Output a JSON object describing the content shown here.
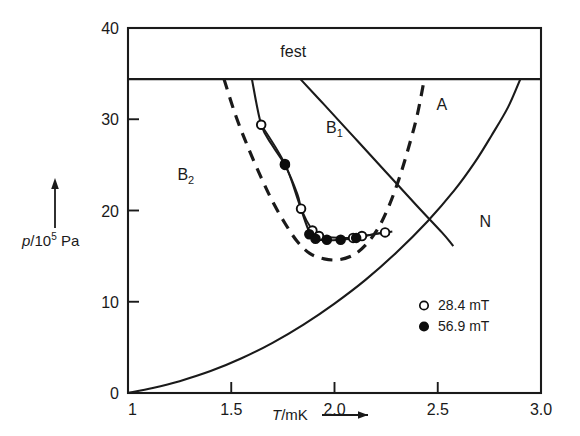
{
  "chart_data": {
    "type": "line",
    "title": "",
    "xlabel": "T/mK",
    "ylabel": "p/10^5 Pa",
    "xlim": [
      1.0,
      3.0
    ],
    "ylim": [
      0,
      40
    ],
    "grid": false,
    "xticks": [
      "1",
      "1.5",
      "2.0",
      "2.5",
      "3.0"
    ],
    "xtick_values": [
      1.0,
      1.5,
      2.0,
      2.5,
      3.0
    ],
    "yticks": [
      "0",
      "10",
      "20",
      "30",
      "40"
    ],
    "ytick_values": [
      0,
      10,
      20,
      30,
      40
    ],
    "legend_position": "lower-right",
    "legend": [
      {
        "marker": "open-circle",
        "label": "28.4 mT"
      },
      {
        "marker": "filled-circle",
        "label": "56.9 mT"
      }
    ],
    "region_labels": [
      {
        "text": "fest",
        "T": 1.8,
        "p": 36.8
      },
      {
        "text": "B",
        "sub": "2",
        "T": 1.28,
        "p": 23.3
      },
      {
        "text": "B",
        "sub": "1",
        "T": 2.0,
        "p": 28.5
      },
      {
        "text": "A",
        "T": 2.52,
        "p": 31.0
      },
      {
        "text": "N",
        "T": 2.73,
        "p": 18.2
      }
    ],
    "series": [
      {
        "name": "28.4 mT",
        "marker": "open-circle",
        "points": [
          {
            "T": 1.645,
            "p": 29.4
          },
          {
            "T": 1.76,
            "p": 25.1
          },
          {
            "T": 1.838,
            "p": 20.2
          },
          {
            "T": 1.893,
            "p": 17.8
          },
          {
            "T": 1.925,
            "p": 17.2
          },
          {
            "T": 2.09,
            "p": 17.0
          },
          {
            "T": 2.133,
            "p": 17.2
          },
          {
            "T": 2.245,
            "p": 17.6
          }
        ]
      },
      {
        "name": "56.9 mT",
        "marker": "filled-circle",
        "points": [
          {
            "T": 1.76,
            "p": 25.0
          },
          {
            "T": 1.878,
            "p": 17.4
          },
          {
            "T": 1.908,
            "p": 16.9
          },
          {
            "T": 1.963,
            "p": 16.8
          },
          {
            "T": 2.03,
            "p": 16.8
          },
          {
            "T": 2.105,
            "p": 17.0
          }
        ]
      }
    ],
    "curves": [
      {
        "name": "melting-line",
        "style": "solid",
        "points": [
          [
            1.0,
            34.4
          ],
          [
            3.0,
            34.4
          ]
        ]
      },
      {
        "name": "superfluid-normal-boundary",
        "style": "solid",
        "points": [
          [
            1.0,
            0.0
          ],
          [
            1.12,
            0.55
          ],
          [
            1.25,
            1.3
          ],
          [
            1.4,
            2.4
          ],
          [
            1.55,
            3.8
          ],
          [
            1.7,
            5.5
          ],
          [
            1.85,
            7.5
          ],
          [
            2.0,
            9.8
          ],
          [
            2.15,
            12.4
          ],
          [
            2.3,
            15.4
          ],
          [
            2.45,
            18.8
          ],
          [
            2.58,
            22.2
          ],
          [
            2.68,
            25.3
          ],
          [
            2.76,
            28.2
          ],
          [
            2.84,
            31.3
          ],
          [
            2.9,
            34.4
          ]
        ]
      },
      {
        "name": "A-B1-boundary",
        "style": "solid",
        "points": [
          [
            1.835,
            34.4
          ],
          [
            1.95,
            31.6
          ],
          [
            2.1,
            27.9
          ],
          [
            2.25,
            24.2
          ],
          [
            2.4,
            20.5
          ],
          [
            2.52,
            17.6
          ],
          [
            2.565,
            16.4
          ],
          [
            2.575,
            16.1
          ]
        ]
      },
      {
        "name": "B2-B1-boundary",
        "style": "solid",
        "points": [
          [
            1.6,
            34.4
          ],
          [
            1.645,
            29.4
          ],
          [
            1.7,
            27.1
          ],
          [
            1.76,
            25.0
          ],
          [
            1.82,
            21.8
          ],
          [
            1.838,
            20.2
          ],
          [
            1.875,
            17.8
          ],
          [
            1.9,
            17.0
          ],
          [
            1.945,
            16.75
          ],
          [
            2.03,
            16.8
          ],
          [
            2.105,
            17.0
          ],
          [
            2.19,
            17.4
          ],
          [
            2.28,
            17.7
          ]
        ]
      },
      {
        "name": "theory-dashed-curve",
        "style": "dashed",
        "points": [
          [
            1.465,
            34.4
          ],
          [
            1.52,
            30.5
          ],
          [
            1.58,
            27.0
          ],
          [
            1.645,
            23.6
          ],
          [
            1.7,
            21.0
          ],
          [
            1.76,
            18.6
          ],
          [
            1.82,
            16.6
          ],
          [
            1.88,
            15.3
          ],
          [
            1.95,
            14.7
          ],
          [
            2.02,
            14.6
          ],
          [
            2.09,
            15.1
          ],
          [
            2.15,
            16.2
          ],
          [
            2.21,
            18.0
          ],
          [
            2.26,
            20.3
          ],
          [
            2.31,
            23.3
          ],
          [
            2.355,
            26.6
          ],
          [
            2.4,
            30.4
          ],
          [
            2.435,
            34.4
          ]
        ]
      }
    ]
  }
}
